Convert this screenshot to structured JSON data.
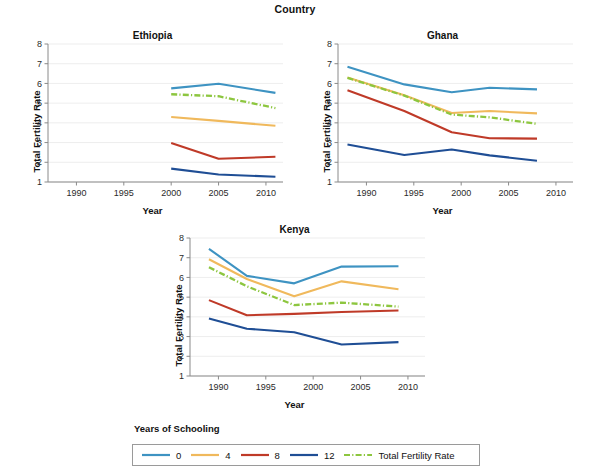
{
  "figure": {
    "title": "Country",
    "xlabel": "Year",
    "ylabel": "Total Fertility Rate"
  },
  "legend": {
    "title": "Years of Schooling",
    "items": [
      {
        "label": "0",
        "color": "#3e93c2",
        "style": "solid"
      },
      {
        "label": "4",
        "color": "#f0b95c",
        "style": "solid"
      },
      {
        "label": "8",
        "color": "#bf3a28",
        "style": "solid"
      },
      {
        "label": "12",
        "color": "#1f4e95",
        "style": "solid"
      },
      {
        "label": "Total Fertility Rate",
        "color": "#8dc63f",
        "style": "dashdot"
      }
    ]
  },
  "axes": {
    "xticks": [
      1990,
      1995,
      2000,
      2005,
      2010
    ],
    "yticks": [
      1,
      2,
      3,
      4,
      5,
      6,
      7,
      8
    ],
    "xlim": [
      1987.0,
      2011.8
    ],
    "ylim": [
      1,
      8
    ]
  },
  "chart_data": {
    "type": "line",
    "title": "Country",
    "xlabel": "Year",
    "ylabel": "Total Fertility Rate",
    "xlim": [
      1987.0,
      2011.8
    ],
    "ylim": [
      1,
      8
    ],
    "xticks": [
      1990,
      1995,
      2000,
      2005,
      2010
    ],
    "yticks": [
      1,
      2,
      3,
      4,
      5,
      6,
      7,
      8
    ],
    "grid": "horizontal",
    "legend_title": "Years of Schooling",
    "legend_position": "bottom",
    "panels": [
      {
        "name": "Ethiopia",
        "x": [
          2000,
          2005,
          2011
        ],
        "series": [
          {
            "name": "0",
            "color": "#3e93c2",
            "style": "solid",
            "values": [
              5.75,
              5.98,
              5.52
            ]
          },
          {
            "name": "4",
            "color": "#f0b95c",
            "style": "solid",
            "values": [
              4.3,
              4.1,
              3.85
            ]
          },
          {
            "name": "8",
            "color": "#bf3a28",
            "style": "solid",
            "values": [
              2.98,
              2.18,
              2.28
            ]
          },
          {
            "name": "12",
            "color": "#1f4e95",
            "style": "solid",
            "values": [
              1.68,
              1.38,
              1.27
            ]
          },
          {
            "name": "Total Fertility Rate",
            "color": "#8dc63f",
            "style": "dashdot",
            "values": [
              5.45,
              5.35,
              4.75
            ]
          }
        ]
      },
      {
        "name": "Ghana",
        "x": [
          1988,
          1994,
          1999,
          2003,
          2008
        ],
        "series": [
          {
            "name": "0",
            "color": "#3e93c2",
            "style": "solid",
            "values": [
              6.85,
              5.95,
              5.55,
              5.78,
              5.7
            ]
          },
          {
            "name": "4",
            "color": "#f0b95c",
            "style": "solid",
            "values": [
              6.3,
              5.4,
              4.5,
              4.6,
              4.48
            ]
          },
          {
            "name": "8",
            "color": "#bf3a28",
            "style": "solid",
            "values": [
              5.65,
              4.6,
              3.52,
              3.22,
              3.2
            ]
          },
          {
            "name": "12",
            "color": "#1f4e95",
            "style": "solid",
            "values": [
              2.9,
              2.37,
              2.65,
              2.35,
              2.08
            ]
          },
          {
            "name": "Total Fertility Rate",
            "color": "#8dc63f",
            "style": "dashdot",
            "values": [
              6.28,
              5.38,
              4.42,
              4.28,
              3.95
            ]
          }
        ]
      },
      {
        "name": "Kenya",
        "x": [
          1989,
          1993,
          1998,
          2003,
          2009
        ],
        "series": [
          {
            "name": "0",
            "color": "#3e93c2",
            "style": "solid",
            "values": [
              7.45,
              6.08,
              5.7,
              6.55,
              6.57
            ]
          },
          {
            "name": "4",
            "color": "#f0b95c",
            "style": "solid",
            "values": [
              6.92,
              5.92,
              5.05,
              5.8,
              5.4
            ]
          },
          {
            "name": "8",
            "color": "#bf3a28",
            "style": "solid",
            "values": [
              4.85,
              4.08,
              4.15,
              4.25,
              4.32
            ]
          },
          {
            "name": "12",
            "color": "#1f4e95",
            "style": "solid",
            "values": [
              3.92,
              3.4,
              3.22,
              2.6,
              2.72
            ]
          },
          {
            "name": "Total Fertility Rate",
            "color": "#8dc63f",
            "style": "dashdot",
            "values": [
              6.52,
              5.55,
              4.6,
              4.72,
              4.52
            ]
          }
        ]
      }
    ]
  }
}
